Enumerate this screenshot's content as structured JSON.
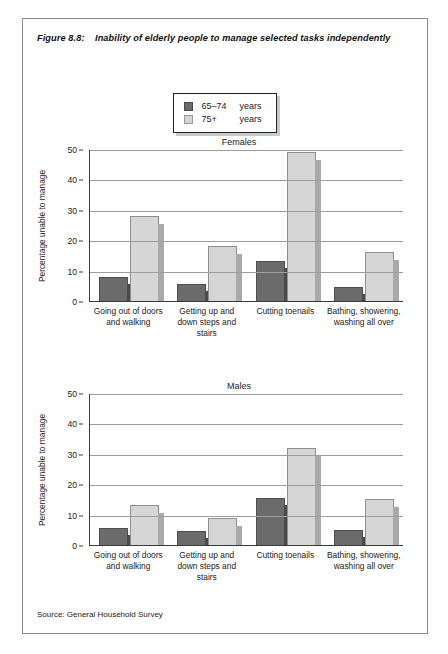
{
  "figure": {
    "number": "Figure 8.8:",
    "title": "Inability of elderly people to manage selected tasks independently",
    "source": "Source: General Household Survey"
  },
  "legend": {
    "items": [
      {
        "key": "65–74",
        "unit": "years",
        "swatch": "dark",
        "color": "#6b6b6b"
      },
      {
        "key": "75+",
        "unit": "years",
        "swatch": "light",
        "color": "#d6d6d6"
      }
    ]
  },
  "axis": {
    "y_title": "Percentage unable to manage",
    "y_ticks": [
      "0",
      "10",
      "20",
      "30",
      "40",
      "50"
    ]
  },
  "chart_data": [
    {
      "type": "bar",
      "title": "Females",
      "xlabel": "",
      "ylabel": "Percentage unable to manage",
      "ylim": [
        0,
        50
      ],
      "ytick_step": 10,
      "grid": true,
      "legend_position": "top-center",
      "categories": [
        "Going out of doors and walking",
        "Getting up and down steps and stairs",
        "Cutting toenails",
        "Bathing, showering, washing all over"
      ],
      "series": [
        {
          "name": "65–74 years",
          "color": "#6b6b6b",
          "values": [
            8,
            5.5,
            13,
            4.5
          ]
        },
        {
          "name": "75+ years",
          "color": "#d6d6d6",
          "values": [
            28,
            18,
            49,
            16
          ]
        }
      ]
    },
    {
      "type": "bar",
      "title": "Males",
      "xlabel": "",
      "ylabel": "Percentage unable to manage",
      "ylim": [
        0,
        50
      ],
      "ytick_step": 10,
      "grid": true,
      "legend_position": "top-center",
      "categories": [
        "Going out of doors and walking",
        "Getting up and down steps and stairs",
        "Cutting toenails",
        "Bathing, showering, washing all over"
      ],
      "series": [
        {
          "name": "65–74 years",
          "color": "#6b6b6b",
          "values": [
            5.5,
            4.5,
            15.5,
            5
          ]
        },
        {
          "name": "75+ years",
          "color": "#d6d6d6",
          "values": [
            13,
            9,
            32,
            15
          ]
        }
      ]
    }
  ]
}
